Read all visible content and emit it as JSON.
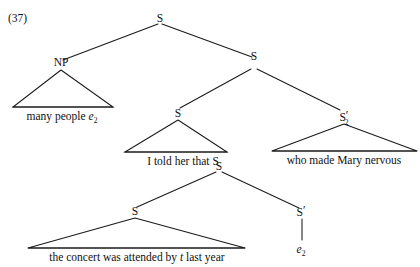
{
  "figure": {
    "example_number": "(37)",
    "type": "syntax-tree"
  },
  "nodes": {
    "root_s": "S",
    "np": "NP",
    "s_right": "S",
    "s_mid_left": "S",
    "s_prime_2": "S",
    "s_prime_2_prime": "′",
    "s_prime_2_subscript": "2",
    "s_lower_mid": "S",
    "s_bottom": "S",
    "s_prime": "S",
    "s_prime_mark": "′"
  },
  "terminals": {
    "np_phrase_text": "many people ",
    "np_phrase_empty": "e",
    "np_phrase_empty_subscript": "2",
    "told_clause": "I told her that ",
    "told_clause_node": "S",
    "relative_clause": "who made Mary nervous",
    "concert_clause_part1": "the concert was attended by ",
    "concert_clause_trace": "t",
    "concert_clause_part2": " last year",
    "empty_category": "e",
    "empty_category_subscript": "2"
  },
  "colors": {
    "ink": "#111111",
    "line": "#1a1a1a",
    "background": "#ffffff"
  }
}
